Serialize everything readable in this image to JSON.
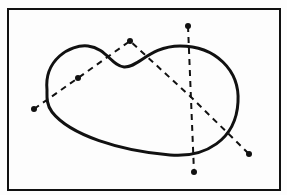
{
  "diagram": {
    "type": "line-drawing",
    "colors": {
      "background": "#fdfdfd",
      "ink": "#111111"
    },
    "frame": {
      "x": 8,
      "y": 9,
      "width": 272,
      "height": 181
    },
    "shape": {
      "name": "kidney-bean-curve",
      "path": "M 47 90 C 44 60, 70 44, 88 46 C 106 48, 112 66, 124 67 C 138 68, 150 46, 180 46 C 215 46, 240 70, 238 102 C 236 140, 205 158, 170 155 C 120 151, 70 135, 52 112 C 46 104, 47 96, 47 90 Z"
    },
    "dashed_lines": [
      {
        "name": "dashed-line-left",
        "points": [
          [
            34,
            109
          ],
          [
            78,
            78
          ],
          [
            130,
            41
          ],
          [
            192,
            98
          ],
          [
            249,
            154
          ]
        ]
      },
      {
        "name": "dashed-line-vertical",
        "points": [
          [
            188,
            26
          ],
          [
            194,
            172
          ]
        ]
      }
    ],
    "points": [
      {
        "name": "left-end-point",
        "x": 34,
        "y": 109
      },
      {
        "name": "mid-left-point",
        "x": 78,
        "y": 78
      },
      {
        "name": "apex-point",
        "x": 130,
        "y": 41
      },
      {
        "name": "top-point",
        "x": 188,
        "y": 26
      },
      {
        "name": "bottom-point",
        "x": 194,
        "y": 172
      },
      {
        "name": "right-end-point",
        "x": 249,
        "y": 154
      }
    ]
  }
}
